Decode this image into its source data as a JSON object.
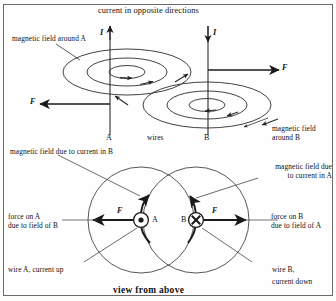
{
  "figure": {
    "type": "physics-diagram",
    "top_caption": "current in opposite directions",
    "bottom_caption": "view from above"
  },
  "upper_diagram": {
    "labels": {
      "field_around_a": "magnetic field around A",
      "field_around_b_line1": "magnetic field",
      "field_around_b_line2": "around B",
      "wires": "wires",
      "wire_a": "A",
      "wire_b": "B",
      "current_a": "I",
      "current_b": "I",
      "force_right": "F",
      "force_left": "F"
    },
    "current_direction_a": "up",
    "current_direction_b": "down",
    "force_on_a": "left",
    "force_on_b": "right"
  },
  "lower_diagram": {
    "labels": {
      "field_due_to_b": "magnetic field due to current in B",
      "field_due_to_a_line1": "magnetic field due",
      "field_due_to_a_line2": "to current in A",
      "force_on_a_line1": "force on A",
      "force_on_a_line2": "due to field of B",
      "force_on_b_line1": "force on B",
      "force_on_b_line2": "due to field of A",
      "wire_a_note": "wire A, current up",
      "wire_b_note_line1": "wire B,",
      "wire_b_note_line2": "current down",
      "wire_a": "A",
      "wire_b": "B",
      "force_a": "F",
      "force_b": "F"
    },
    "wire_a_symbol": "dot-out-of-page",
    "wire_b_symbol": "cross-into-page"
  },
  "colors": {
    "ink": "#1a1a1a",
    "line": "#2b2b2b",
    "frame": "#6a6a6a",
    "background": "#fefefe"
  }
}
